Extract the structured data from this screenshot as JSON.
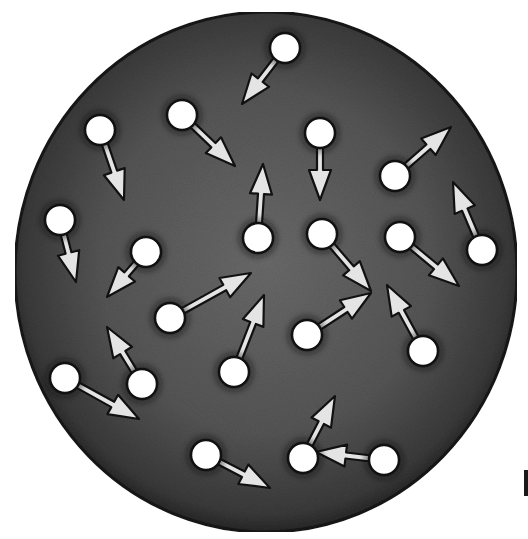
{
  "figure": {
    "container": {
      "cx": 266,
      "cy": 272,
      "rx": 251,
      "ry": 260,
      "fill": "#4a4a4a",
      "rim": "#161616"
    },
    "particle_style": {
      "radius": 15,
      "fill": "#ffffff",
      "stroke": "#111111"
    },
    "arrow_style": {
      "fill": "#e4e4e4",
      "stroke": "#111111"
    },
    "particles": [
      {
        "x": 285,
        "y": 48,
        "tx": 242,
        "ty": 104
      },
      {
        "x": 182,
        "y": 115,
        "tx": 235,
        "ty": 166
      },
      {
        "x": 100,
        "y": 130,
        "tx": 124,
        "ty": 200
      },
      {
        "x": 320,
        "y": 133,
        "tx": 320,
        "ty": 200
      },
      {
        "x": 395,
        "y": 176,
        "tx": 451,
        "ty": 127
      },
      {
        "x": 258,
        "y": 238,
        "tx": 263,
        "ty": 164
      },
      {
        "x": 322,
        "y": 234,
        "tx": 371,
        "ty": 291
      },
      {
        "x": 400,
        "y": 237,
        "tx": 459,
        "ty": 286
      },
      {
        "x": 482,
        "y": 250,
        "tx": 453,
        "ty": 182
      },
      {
        "x": 60,
        "y": 220,
        "tx": 76,
        "ty": 282
      },
      {
        "x": 146,
        "y": 252,
        "tx": 107,
        "ty": 297
      },
      {
        "x": 170,
        "y": 318,
        "tx": 251,
        "ty": 273
      },
      {
        "x": 307,
        "y": 335,
        "tx": 371,
        "ty": 293
      },
      {
        "x": 423,
        "y": 351,
        "tx": 387,
        "ty": 285
      },
      {
        "x": 234,
        "y": 372,
        "tx": 264,
        "ty": 295
      },
      {
        "x": 142,
        "y": 384,
        "tx": 107,
        "ty": 327
      },
      {
        "x": 65,
        "y": 378,
        "tx": 139,
        "ty": 419
      },
      {
        "x": 206,
        "y": 455,
        "tx": 270,
        "ty": 488
      },
      {
        "x": 303,
        "y": 458,
        "tx": 335,
        "ty": 396
      },
      {
        "x": 384,
        "y": 460,
        "tx": 316,
        "ty": 452
      }
    ]
  }
}
